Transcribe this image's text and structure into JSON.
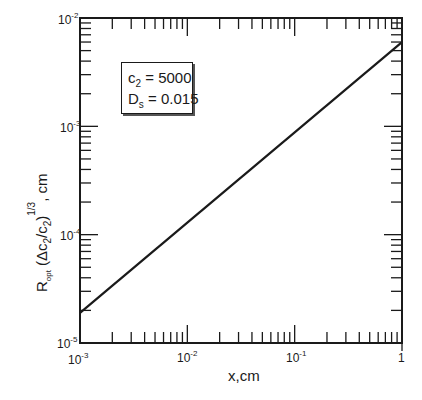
{
  "chart_data": {
    "type": "line",
    "title": "",
    "xlabel": "x,cm",
    "ylabel": "R_opt (Δc2/c2)^(1/3), cm",
    "xscale": "log",
    "yscale": "log",
    "xlim": [
      0.001,
      1
    ],
    "ylim": [
      1e-05,
      0.01
    ],
    "x_ticks": [
      "10^-3",
      "10^-2",
      "10^-1",
      "1"
    ],
    "y_ticks": [
      "10^-5",
      "10^-4",
      "10^-3",
      "10^-2"
    ],
    "grid": false,
    "legend_position": "upper-left inset box",
    "annotations": [
      "c2 = 5000",
      "Ds = 0.015"
    ],
    "series": [
      {
        "name": "R_opt",
        "x": [
          0.001,
          0.01,
          0.1,
          1
        ],
        "y": [
          1.9e-05,
          0.00012,
          0.0009,
          0.006
        ]
      }
    ]
  },
  "labels": {
    "x_axis": "x,cm",
    "y_axis_main": "R",
    "y_axis_sub": "opt",
    "y_axis_paren": "(Δc",
    "y_axis_sub2": "2",
    "y_axis_div": "/c",
    "y_axis_sub3": "2",
    "y_axis_close": ")",
    "y_axis_exp": "1/3",
    "y_axis_unit": ", cm",
    "x_tick_1": "10",
    "x_tick_1_exp": "-3",
    "x_tick_2": "10",
    "x_tick_2_exp": "-2",
    "x_tick_3": "10",
    "x_tick_3_exp": "-1",
    "x_tick_4": "1",
    "y_tick_1": "10",
    "y_tick_1_exp": "-5",
    "y_tick_2": "10",
    "y_tick_2_exp": "-4",
    "y_tick_3": "10",
    "y_tick_3_exp": "-3",
    "y_tick_4": "10",
    "y_tick_4_exp": "-2"
  },
  "legend": {
    "c_label": "c",
    "c_sub": "2",
    "c_value": " = 5000",
    "d_label": "D",
    "d_sub": "s",
    "d_value": " = 0.015"
  }
}
